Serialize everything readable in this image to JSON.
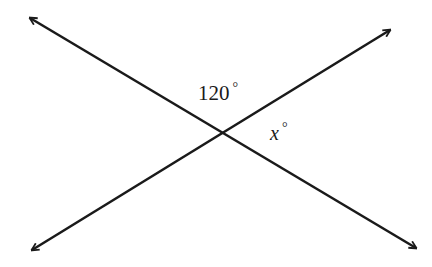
{
  "diagram": {
    "type": "intersecting-lines",
    "line_color": "#1a1a1a",
    "background": "#ffffff",
    "lines": [
      {
        "name": "line-a",
        "from": [
          30,
          18
        ],
        "to": [
          416,
          248
        ],
        "arrows": "both"
      },
      {
        "name": "line-b",
        "from": [
          32,
          250
        ],
        "to": [
          390,
          30
        ],
        "arrows": "both"
      }
    ],
    "intersection": [
      224,
      132
    ],
    "labels": {
      "angle_top": {
        "value": "120",
        "unit": "°"
      },
      "angle_right": {
        "value": "x",
        "unit": "°"
      }
    }
  }
}
